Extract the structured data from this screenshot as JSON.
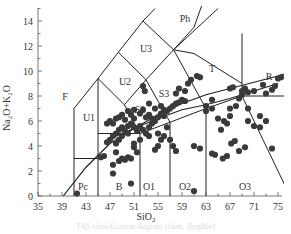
{
  "chart_data": {
    "type": "scatter",
    "title": "",
    "xlabel": "SiO2",
    "ylabel": "Na2O+K2O",
    "xlim": [
      35,
      77
    ],
    "ylim": [
      0,
      15
    ],
    "x_ticks": [
      35,
      39,
      43,
      47,
      51,
      55,
      59,
      63,
      67,
      71,
      75
    ],
    "y_ticks": [
      0,
      2,
      4,
      6,
      8,
      10,
      12,
      14
    ],
    "grid": false,
    "legend": null,
    "field_labels": [
      {
        "label": "Ph",
        "x": 59.5,
        "y": 14.2
      },
      {
        "label": "U3",
        "x": 53,
        "y": 11.8
      },
      {
        "label": "T",
        "x": 64,
        "y": 10.2
      },
      {
        "label": "R",
        "x": 73.5,
        "y": 9.6
      },
      {
        "label": "F",
        "x": 39.5,
        "y": 8.0
      },
      {
        "label": "U2",
        "x": 49.5,
        "y": 9.2
      },
      {
        "label": "S3",
        "x": 56,
        "y": 8.2
      },
      {
        "label": "U1",
        "x": 43.5,
        "y": 6.3
      },
      {
        "label": "S2",
        "x": 52,
        "y": 6.9
      },
      {
        "label": "Pc",
        "x": 42.5,
        "y": 0.8
      },
      {
        "label": "B",
        "x": 48.5,
        "y": 0.8
      },
      {
        "label": "O1",
        "x": 53.5,
        "y": 0.8
      },
      {
        "label": "O2",
        "x": 59.5,
        "y": 0.8
      },
      {
        "label": "O3",
        "x": 69.5,
        "y": 0.8
      }
    ],
    "boundaries": [
      [
        [
          41,
          0
        ],
        [
          41,
          7
        ],
        [
          45,
          9.4
        ],
        [
          48.4,
          11.5
        ],
        [
          52.5,
          14
        ],
        [
          54.5,
          15
        ]
      ],
      [
        [
          41,
          3
        ],
        [
          45,
          3
        ]
      ],
      [
        [
          45,
          0
        ],
        [
          45,
          5
        ],
        [
          52,
          5
        ],
        [
          57,
          5.9
        ],
        [
          63,
          7
        ],
        [
          69,
          8
        ],
        [
          77,
          8
        ]
      ],
      [
        [
          52,
          0
        ],
        [
          52,
          5
        ]
      ],
      [
        [
          57,
          0
        ],
        [
          57,
          5.9
        ]
      ],
      [
        [
          63,
          0
        ],
        [
          63,
          7
        ]
      ],
      [
        [
          45,
          5
        ],
        [
          45,
          9.4
        ]
      ],
      [
        [
          45,
          9.4
        ],
        [
          49.4,
          7.3
        ],
        [
          53,
          9.3
        ],
        [
          57.6,
          11.7
        ],
        [
          61,
          13.5
        ],
        [
          63,
          16.2
        ]
      ],
      [
        [
          49.4,
          7.3
        ],
        [
          52,
          5
        ]
      ],
      [
        [
          48.4,
          11.5
        ],
        [
          53,
          9.3
        ]
      ],
      [
        [
          52.5,
          14
        ],
        [
          57.6,
          11.7
        ]
      ],
      [
        [
          53,
          9.3
        ],
        [
          57,
          5.9
        ]
      ],
      [
        [
          57.6,
          11.7
        ],
        [
          63,
          7
        ]
      ],
      [
        [
          57.6,
          11.7
        ],
        [
          61,
          11.4
        ],
        [
          69,
          9
        ]
      ],
      [
        [
          69,
          8
        ],
        [
          69,
          13
        ]
      ],
      [
        [
          69,
          8
        ],
        [
          77,
          0
        ]
      ],
      [
        [
          57.6,
          11.7
        ],
        [
          65,
          15
        ]
      ]
    ],
    "alkaline_line": [
      [
        39.2,
        0
      ],
      [
        43,
        2.3
      ],
      [
        47,
        4.2
      ],
      [
        51,
        5.4
      ],
      [
        55,
        6.5
      ],
      [
        59,
        7.4
      ],
      [
        63,
        8.1
      ],
      [
        67,
        8.6
      ],
      [
        71,
        9.1
      ],
      [
        75,
        9.6
      ],
      [
        77,
        9.9
      ]
    ],
    "subalkaline_line": [
      [
        47,
        4.6
      ],
      [
        51,
        5.4
      ],
      [
        55,
        6.2
      ],
      [
        59,
        6.9
      ],
      [
        63,
        7.3
      ],
      [
        67,
        7.8
      ],
      [
        71,
        8.4
      ],
      [
        75,
        9.0
      ]
    ],
    "points": [
      [
        41.5,
        0.2
      ],
      [
        45.5,
        3.1
      ],
      [
        46,
        3.2
      ],
      [
        47.5,
        1.8
      ],
      [
        47.5,
        2.5
      ],
      [
        48,
        3.5
      ],
      [
        48.5,
        2.8
      ],
      [
        49,
        3.0
      ],
      [
        49.5,
        2.9
      ],
      [
        50,
        3.1
      ],
      [
        50.5,
        3.0
      ],
      [
        50.5,
        1.0
      ],
      [
        51,
        4.2
      ],
      [
        51,
        3.9
      ],
      [
        51.5,
        3.5
      ],
      [
        46.5,
        4.3
      ],
      [
        47,
        4.5
      ],
      [
        47.5,
        4.8
      ],
      [
        48,
        4.2
      ],
      [
        48.5,
        4.5
      ],
      [
        48,
        5.0
      ],
      [
        48.5,
        5.3
      ],
      [
        49,
        5.5
      ],
      [
        49,
        4.8
      ],
      [
        49.5,
        5.2
      ],
      [
        50,
        5.0
      ],
      [
        50,
        5.6
      ],
      [
        50.5,
        5.8
      ],
      [
        51,
        5.5
      ],
      [
        51.5,
        5.2
      ],
      [
        52,
        5.6
      ],
      [
        52.5,
        5.3
      ],
      [
        53,
        5.0
      ],
      [
        53.5,
        4.8
      ],
      [
        52,
        4.5
      ],
      [
        46.5,
        5.8
      ],
      [
        47,
        6.0
      ],
      [
        47.5,
        5.8
      ],
      [
        48,
        6.2
      ],
      [
        48.5,
        6.3
      ],
      [
        49,
        6.5
      ],
      [
        49.5,
        6.1
      ],
      [
        50,
        6.8
      ],
      [
        50.5,
        6.5
      ],
      [
        51,
        6.9
      ],
      [
        51,
        6.2
      ],
      [
        52,
        6.6
      ],
      [
        52.5,
        6.9
      ],
      [
        53,
        6.3
      ],
      [
        53.5,
        6.5
      ],
      [
        54,
        6.2
      ],
      [
        54.5,
        6.0
      ],
      [
        55,
        6.3
      ],
      [
        55.5,
        6.6
      ],
      [
        56,
        6.4
      ],
      [
        52.5,
        8.8
      ],
      [
        52.8,
        8.4
      ],
      [
        53.5,
        7.4
      ],
      [
        54.5,
        7.0
      ],
      [
        55.5,
        7.2
      ],
      [
        56,
        6.9
      ],
      [
        56.5,
        6.8
      ],
      [
        57,
        7.0
      ],
      [
        57.5,
        7.2
      ],
      [
        58,
        7.4
      ],
      [
        58.5,
        7.5
      ],
      [
        59,
        7.7
      ],
      [
        59.5,
        7.6
      ],
      [
        58,
        8.2
      ],
      [
        58.5,
        8.6
      ],
      [
        59.5,
        8.4
      ],
      [
        60,
        9.0
      ],
      [
        60.5,
        9.3
      ],
      [
        61.5,
        9.6
      ],
      [
        62,
        9.5
      ],
      [
        53.5,
        5.5
      ],
      [
        54,
        5.8
      ],
      [
        55,
        5.0
      ],
      [
        55.5,
        4.5
      ],
      [
        56,
        4.8
      ],
      [
        55,
        4.0
      ],
      [
        54.5,
        3.7
      ],
      [
        63,
        6.8
      ],
      [
        63,
        7.2
      ],
      [
        64,
        7.7
      ],
      [
        64,
        7.0
      ],
      [
        65,
        6.2
      ],
      [
        65.5,
        5.3
      ],
      [
        66,
        6.0
      ],
      [
        66.5,
        5.8
      ],
      [
        67,
        6.4
      ],
      [
        67,
        7.0
      ],
      [
        68,
        7.2
      ],
      [
        68.5,
        7.8
      ],
      [
        69,
        8.1
      ],
      [
        69,
        8.4
      ],
      [
        70,
        7.0
      ],
      [
        70,
        6.0
      ],
      [
        71,
        5.6
      ],
      [
        72,
        6.4
      ],
      [
        72,
        5.5
      ],
      [
        73,
        6.0
      ],
      [
        67,
        8.6
      ],
      [
        67.5,
        8.7
      ],
      [
        69.5,
        8.6
      ],
      [
        70,
        8.3
      ],
      [
        71,
        8.4
      ],
      [
        72.5,
        8.9
      ],
      [
        73,
        8.2
      ],
      [
        74,
        8.5
      ],
      [
        74.5,
        8.8
      ],
      [
        75,
        9.4
      ],
      [
        75.5,
        9.5
      ],
      [
        74,
        3.8
      ],
      [
        61,
        0.4
      ],
      [
        57,
        4.5
      ],
      [
        57.5,
        4.0
      ],
      [
        58,
        3.6
      ],
      [
        61,
        4.0
      ],
      [
        62,
        3.8
      ],
      [
        64,
        3.4
      ],
      [
        64.5,
        3.3
      ],
      [
        66.5,
        3.2
      ],
      [
        65.8,
        3.0
      ],
      [
        67.2,
        4.2
      ],
      [
        67.8,
        4.4
      ],
      [
        68.5,
        3.6
      ],
      [
        69.5,
        3.9
      ],
      [
        56.5,
        5.5
      ]
    ],
    "caption": "TAS classification diagram (faint, illegible)"
  },
  "axis_text": {
    "xlabel_main": "SiO",
    "xlabel_sub": "2",
    "ylabel": "Na₂O+K₂O"
  }
}
